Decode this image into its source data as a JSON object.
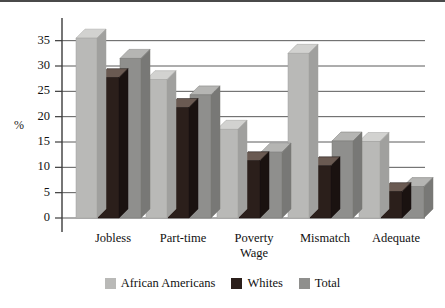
{
  "chart_data": {
    "type": "bar",
    "title": "",
    "subtitle": "",
    "xlabel": "",
    "ylabel": "%",
    "ylim": [
      0,
      37.5
    ],
    "yticks": [
      0,
      5,
      10,
      15,
      20,
      25,
      30,
      35
    ],
    "ytick_labels": [
      "0",
      "5",
      "10",
      "15",
      "20",
      "25",
      "30",
      "35"
    ],
    "grid": true,
    "grid_axis": "y",
    "legend_position": "bottom-center",
    "style": "3d-bars",
    "categories": [
      "Jobless",
      "Part-time",
      "Poverty Wage",
      "Mismatch",
      "Adequate"
    ],
    "category_lines": [
      [
        "Jobless"
      ],
      [
        "Part-time"
      ],
      [
        "Poverty",
        "Wage"
      ],
      [
        "Mismatch"
      ],
      [
        "Adequate"
      ]
    ],
    "series": [
      {
        "name": "African Americans",
        "color": "#b9b9b7",
        "top_color": "#d2d2d0",
        "side_color": "#a0a09e",
        "values": [
          35.5,
          27.3,
          17.5,
          32.5,
          15.1
        ]
      },
      {
        "name": "Whites",
        "color": "#2b1f1b",
        "top_color": "#6a5a52",
        "side_color": "#1a1210",
        "values": [
          27.7,
          21.8,
          11.3,
          10.3,
          5.2
        ]
      },
      {
        "name": "Total",
        "color": "#8f8f8d",
        "top_color": "#b5b5b3",
        "side_color": "#787876",
        "values": [
          31.5,
          24.3,
          13.0,
          15.2,
          6.2
        ]
      }
    ]
  },
  "axis": {
    "y_title": "%"
  },
  "colors": {
    "grid": "#5a5a5a",
    "axis": "#3c3c3c",
    "text": "#111111",
    "background": "#ffffff"
  }
}
